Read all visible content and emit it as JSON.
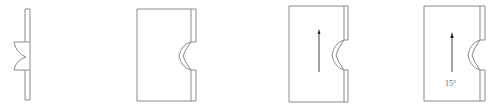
{
  "diagram": {
    "stroke_color": "#8a8a8a",
    "arrow_color": "#222222",
    "figures": [
      {
        "id": 1,
        "name": "narrow-strip-with-notch",
        "label": ""
      },
      {
        "id": 2,
        "name": "panel-with-notch",
        "label": ""
      },
      {
        "id": 3,
        "name": "panel-with-notch-and-arrow",
        "label": ""
      },
      {
        "id": 4,
        "name": "panel-with-notch-arrow-and-angle",
        "label": "15°"
      }
    ]
  }
}
